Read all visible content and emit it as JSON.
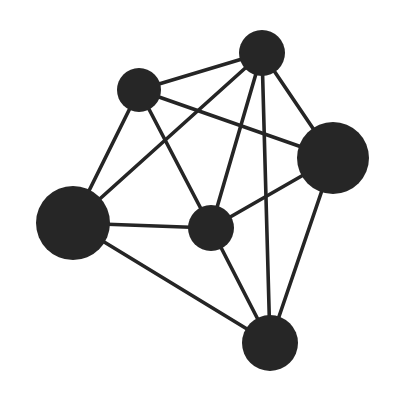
{
  "diagram": {
    "type": "network-graph",
    "colors": {
      "node": "#262626",
      "edge": "#252525",
      "background": "#ffffff"
    },
    "nodes": [
      {
        "id": "top",
        "size": "small"
      },
      {
        "id": "upper-left",
        "size": "small"
      },
      {
        "id": "right",
        "size": "large"
      },
      {
        "id": "left",
        "size": "large"
      },
      {
        "id": "center",
        "size": "small"
      },
      {
        "id": "bottom",
        "size": "medium"
      }
    ],
    "edges": [
      [
        "top",
        "upper-left"
      ],
      [
        "top",
        "left"
      ],
      [
        "top",
        "center"
      ],
      [
        "top",
        "bottom"
      ],
      [
        "top",
        "right"
      ],
      [
        "upper-left",
        "right"
      ],
      [
        "upper-left",
        "left"
      ],
      [
        "upper-left",
        "center"
      ],
      [
        "left",
        "center"
      ],
      [
        "left",
        "bottom"
      ],
      [
        "center",
        "right"
      ],
      [
        "center",
        "bottom"
      ],
      [
        "right",
        "bottom"
      ]
    ]
  }
}
